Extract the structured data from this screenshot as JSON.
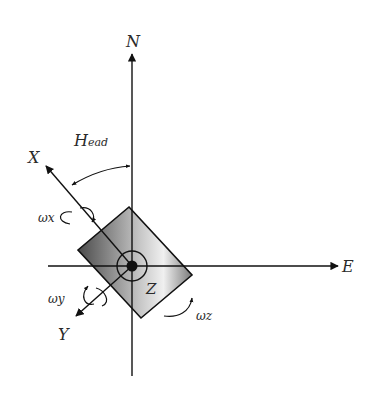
{
  "diagram": {
    "type": "coordinate-frame",
    "labels": {
      "north": "N",
      "east": "E",
      "x_axis": "X",
      "y_axis": "Y",
      "z_axis": "Z",
      "heading": "H",
      "heading_sub": "ead",
      "omega_x": "ωx",
      "omega_y": "ωy",
      "omega_z": "ωz"
    },
    "colors": {
      "stroke": "#111111",
      "body_dark": "#555555",
      "body_light": "#e8e8e8"
    }
  }
}
